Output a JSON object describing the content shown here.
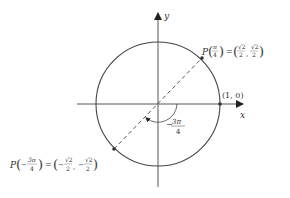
{
  "diagram": {
    "type": "unit-circle",
    "axes": {
      "x_label": "x",
      "y_label": "y"
    },
    "points": {
      "p_pi_4": {
        "name": "P",
        "arg_num": "π",
        "arg_den": "4",
        "eq": "=",
        "x_num": "√2",
        "x_den": "2",
        "y_num": "√2",
        "y_den": "2",
        "comma": ","
      },
      "p_neg_3pi_4": {
        "name": "P",
        "arg_sign": "−",
        "arg_num": "3π",
        "arg_den": "4",
        "eq": "=",
        "x_sign": "−",
        "x_num": "√2",
        "x_den": "2",
        "y_sign": "−",
        "y_num": "√2",
        "y_den": "2",
        "comma": ","
      },
      "one_zero": "(1, 0)"
    },
    "angle_label": {
      "sign": "−",
      "num": "3π",
      "den": "4"
    },
    "colors": {
      "stroke": "#333333",
      "text": "#333333",
      "background": "#ffffff"
    }
  }
}
